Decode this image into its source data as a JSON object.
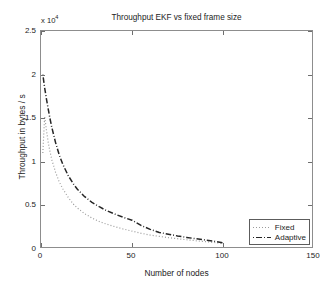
{
  "figure": {
    "background": "#ffffff",
    "axes_border_color": "#8d8d8d"
  },
  "chart_data": {
    "type": "line",
    "title": "Throughput EKF vs fixed frame size",
    "xlabel": "Number of nodes",
    "ylabel": "Throughput in bytes / s",
    "y_exponent_prefix": "x 10",
    "y_exponent_power": "4",
    "y_scale_factor": 10000,
    "grid": false,
    "xlim": [
      0,
      150
    ],
    "ylim": [
      0,
      25000
    ],
    "xticks": [
      0,
      50,
      100,
      150
    ],
    "xtick_labels": [
      "0",
      "50",
      "100",
      "150"
    ],
    "yticks": [
      0,
      5000,
      10000,
      15000,
      20000,
      25000
    ],
    "ytick_labels": [
      "0",
      "0.5",
      "1",
      "1.5",
      "2",
      "2.5"
    ],
    "legend_position": "lower right",
    "series": [
      {
        "name": "Fixed",
        "linestyle": "dotted",
        "color": "#9a9a9a",
        "x": [
          1,
          2,
          3,
          4,
          5,
          6,
          8,
          10,
          12,
          15,
          18,
          20,
          24,
          28,
          32,
          36,
          40,
          45,
          50,
          55,
          60,
          65,
          70,
          75,
          80,
          85,
          90,
          95,
          100
        ],
        "y": [
          11000,
          15200,
          13600,
          12200,
          11100,
          10200,
          8800,
          7700,
          6900,
          5900,
          5100,
          4700,
          4050,
          3550,
          3150,
          2850,
          2600,
          2300,
          2050,
          1800,
          1600,
          1450,
          1300,
          1180,
          1060,
          950,
          850,
          750,
          620
        ]
      },
      {
        "name": "Adaptive",
        "linestyle": "dashdot",
        "color": "#262626",
        "x": [
          1,
          2,
          3,
          4,
          5,
          6,
          8,
          10,
          12,
          15,
          18,
          20,
          24,
          28,
          32,
          36,
          40,
          45,
          50,
          55,
          60,
          65,
          70,
          75,
          80,
          85,
          90,
          95,
          100
        ],
        "y": [
          20000,
          18500,
          17200,
          16000,
          14900,
          13900,
          12200,
          10800,
          9700,
          8400,
          7400,
          6850,
          6000,
          5350,
          4850,
          4400,
          4050,
          3650,
          3300,
          2700,
          2250,
          1900,
          1700,
          1500,
          1330,
          1180,
          1040,
          900,
          700
        ]
      }
    ]
  },
  "legend": {
    "entries": [
      {
        "label": "Fixed",
        "style": "dotted",
        "color": "#9a9a9a"
      },
      {
        "label": "Adaptive",
        "style": "dashdot",
        "color": "#262626"
      }
    ]
  }
}
